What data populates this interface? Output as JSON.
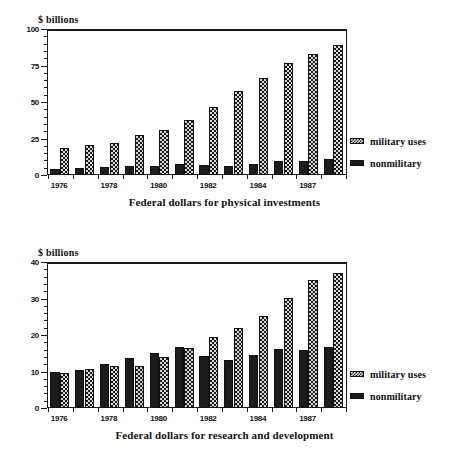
{
  "chart_data": [
    {
      "id": "physical-investments",
      "type": "bar",
      "title": "Federal dollars for physical investments",
      "ylabel": "$ billions",
      "xlabel": "",
      "ylim": [
        0,
        100
      ],
      "yticks": [
        0,
        25,
        50,
        75,
        100
      ],
      "ytick_labels": [
        "0",
        "25",
        "50",
        "75",
        "100"
      ],
      "minor_tick_step": 5,
      "grid": false,
      "legend_position": "right",
      "categories": [
        "1976",
        "1977",
        "1978",
        "1979",
        "1980",
        "1981",
        "1982",
        "1983",
        "1984",
        "1985",
        "1987"
      ],
      "xtick_labels": [
        "1976",
        "",
        "1978",
        "",
        "1980",
        "",
        "1982",
        "",
        "1984",
        "",
        "1987"
      ],
      "series": [
        {
          "name": "nonmilitary",
          "fill": "solid-black",
          "values": [
            4.5,
            5.2,
            6.0,
            7.0,
            7.0,
            8.0,
            7.5,
            6.8,
            8.5,
            10.5,
            10.2,
            11.8
          ]
        },
        {
          "name": "military uses",
          "fill": "checkerboard",
          "values": [
            19.0,
            21.0,
            22.5,
            28.0,
            31.5,
            38.5,
            47.5,
            58.5,
            67.0,
            77.5,
            83.5,
            89.5
          ]
        }
      ]
    },
    {
      "id": "research-and-development",
      "type": "bar",
      "title": "Federal dollars for research and development",
      "ylabel": "$ billions",
      "xlabel": "",
      "ylim": [
        0,
        40
      ],
      "yticks": [
        0,
        10,
        20,
        30,
        40
      ],
      "ytick_labels": [
        "0",
        "10",
        "20",
        "30",
        "40"
      ],
      "minor_tick_step": 2,
      "grid": false,
      "legend_position": "right",
      "categories": [
        "1976",
        "1977",
        "1978",
        "1979",
        "1980",
        "1981",
        "1982",
        "1983",
        "1984",
        "1985",
        "1987"
      ],
      "xtick_labels": [
        "1976",
        "",
        "1978",
        "",
        "1980",
        "",
        "1982",
        "",
        "1984",
        "",
        "1987"
      ],
      "series": [
        {
          "name": "nonmilitary",
          "fill": "solid-black",
          "values": [
            10.2,
            10.6,
            12.3,
            14.1,
            15.4,
            17.0,
            14.4,
            13.3,
            14.9,
            16.5,
            16.1,
            17.0
          ]
        },
        {
          "name": "military uses",
          "fill": "checkerboard",
          "values": [
            9.9,
            10.9,
            11.9,
            11.9,
            14.3,
            16.8,
            19.7,
            22.2,
            25.5,
            30.3,
            35.4,
            37.3
          ]
        }
      ]
    }
  ],
  "legend": {
    "military_label": "military uses",
    "nonmilitary_label": "nonmilitary"
  },
  "colors": {
    "ink": "#111111",
    "bar_nonmilitary": "#1c1c1c",
    "bar_military_base": "#d8d8d8",
    "background": "#ffffff"
  }
}
